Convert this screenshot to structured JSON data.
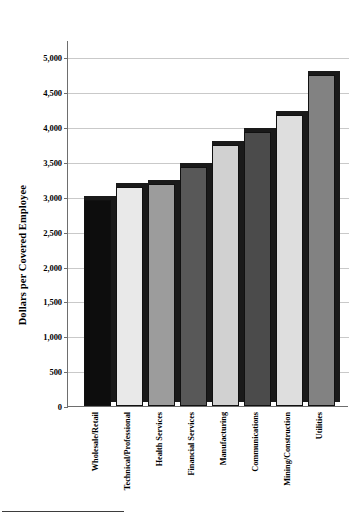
{
  "chart_data": {
    "type": "bar",
    "title": "",
    "subtitle": "",
    "xlabel": "",
    "ylabel": "Dollars per Covered Employee",
    "categories": [
      "Wholesale/Retail",
      "Technical/Professional",
      "Health Services",
      "Financial Services",
      "Manufacturing",
      "Communications",
      "Mining/Construction",
      "Utilities"
    ],
    "values": [
      2960,
      3140,
      3180,
      3430,
      3750,
      3930,
      4180,
      4750
    ],
    "ylim": [
      0,
      5250
    ],
    "yticks": [
      0,
      500,
      1000,
      1500,
      2000,
      2500,
      3000,
      3500,
      4000,
      4500,
      5000
    ],
    "ytick_labels": [
      "0",
      "500",
      "1,000",
      "1,500",
      "2,000",
      "2,500",
      "3,000",
      "3,500",
      "4,000",
      "4,500",
      "5,000"
    ],
    "grid": true,
    "legend": "none",
    "bar_colors": [
      "#0d0d0d",
      "#e9e9e9",
      "#9c9c9c",
      "#585858",
      "#d1d1d1",
      "#4b4b4b",
      "#dedede",
      "#828282"
    ],
    "bar_shadow_color": "#1a1a1a",
    "gridline_color": "#c9c9c9",
    "axis_color": "#6e6e6e",
    "background_color": "#ffffff"
  },
  "footer": {
    "note": ""
  }
}
